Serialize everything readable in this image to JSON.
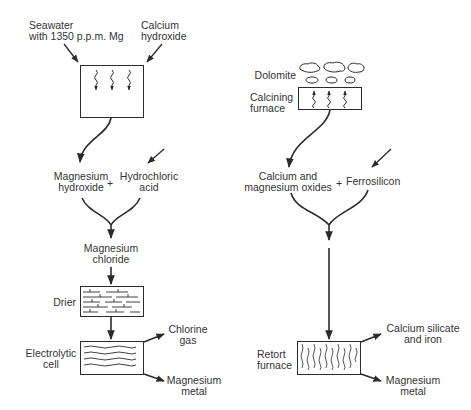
{
  "diagram": {
    "left_process": {
      "inputs": {
        "seawater": [
          "Seawater",
          "with 1350 p.p.m. Mg"
        ],
        "calcium_hydroxide": [
          "Calcium",
          "hydroxide"
        ]
      },
      "intermediate_1": [
        "Magnesium",
        "hydroxide"
      ],
      "plus": "+",
      "reagent": [
        "Hydrochloric",
        "acid"
      ],
      "intermediate_2": [
        "Magnesium",
        "chloride"
      ],
      "drier_label": "Drier",
      "cell_label": [
        "Electrolytic",
        "cell"
      ],
      "outputs": {
        "gas": [
          "Chlorine",
          "gas"
        ],
        "metal": [
          "Magnesium",
          "metal"
        ]
      }
    },
    "right_process": {
      "feed_label": "Dolomite",
      "furnace_label": [
        "Calcining",
        "furnace"
      ],
      "intermediate": [
        "Calcium and",
        "magnesium oxides"
      ],
      "plus": "+",
      "reagent": "Ferrosilicon",
      "retort_label": [
        "Retort",
        "furnace"
      ],
      "outputs": {
        "byproduct": [
          "Calcium silicate",
          "and iron"
        ],
        "metal": [
          "Magnesium",
          "metal"
        ]
      }
    },
    "colors": {
      "line": "#2b2b2b",
      "text": "#333333",
      "background": "#ffffff"
    }
  }
}
